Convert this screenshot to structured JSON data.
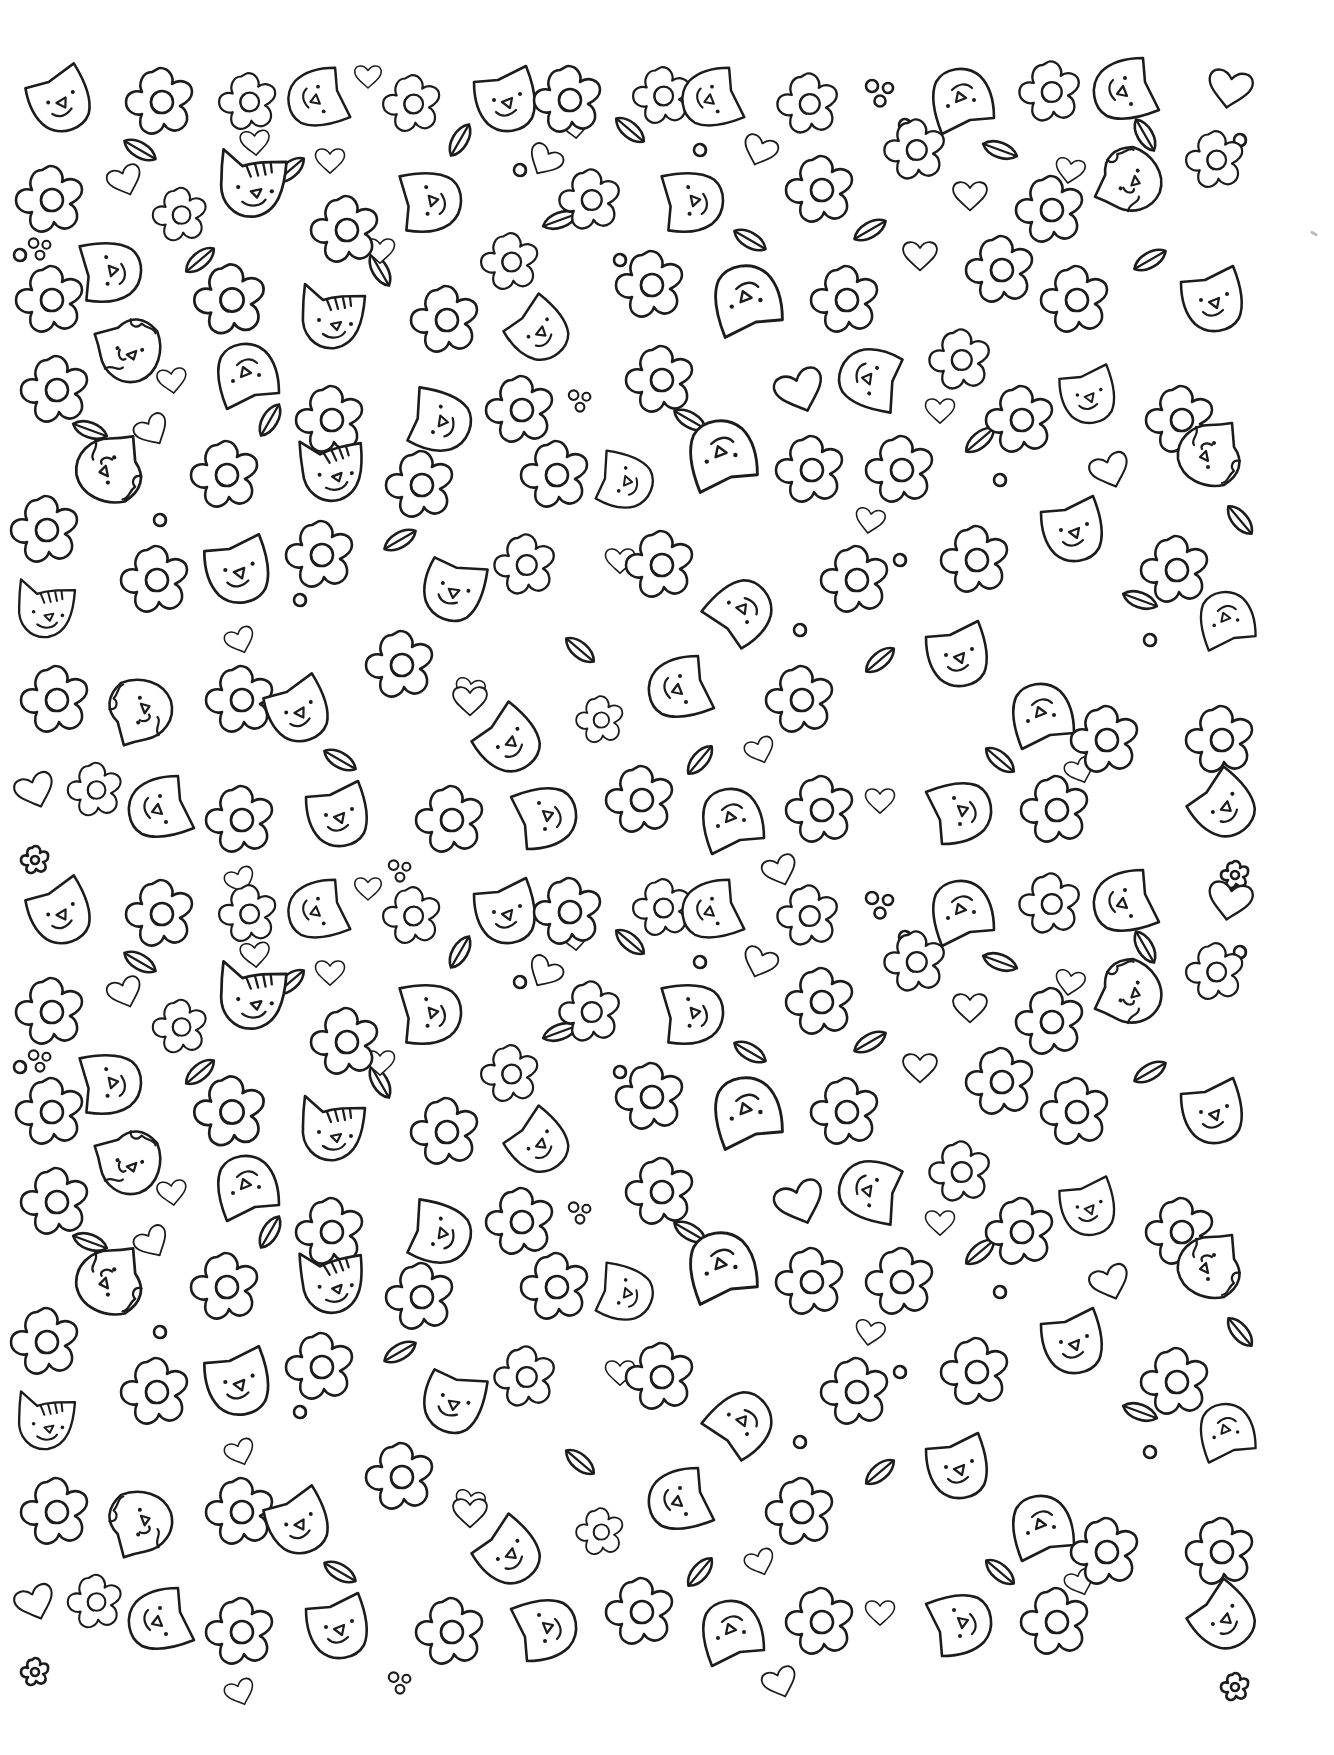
{
  "page": {
    "type": "coloring-page",
    "background": "#ffffff",
    "line_color": "#1c1c1c",
    "pattern_bounds": {
      "x": 10,
      "y": 62,
      "width": 1270,
      "height": 1630
    }
  },
  "motif_types": [
    "cat",
    "cat-striped",
    "cat-spotted",
    "flower",
    "flower-small",
    "heart",
    "leaf",
    "dots"
  ],
  "tile": {
    "origin_y_offsets": [
      0,
      812
    ],
    "motifs": [
      {
        "t": "cat",
        "x": 62,
        "y": 100,
        "r": -10,
        "s": 1
      },
      {
        "t": "flower",
        "x": 160,
        "y": 102,
        "r": 0,
        "s": 1
      },
      {
        "t": "flower",
        "x": 248,
        "y": 102,
        "r": 0,
        "s": 0.85
      },
      {
        "t": "cat",
        "x": 318,
        "y": 100,
        "r": 90,
        "s": 0.95
      },
      {
        "t": "heart",
        "x": 368,
        "y": 76,
        "r": 0,
        "s": 0.55
      },
      {
        "t": "flower",
        "x": 412,
        "y": 104,
        "r": 0,
        "s": 0.85
      },
      {
        "t": "cat",
        "x": 508,
        "y": 100,
        "r": 0,
        "s": 1
      },
      {
        "t": "flower",
        "x": 568,
        "y": 100,
        "r": 0,
        "s": 1
      },
      {
        "t": "flower",
        "x": 662,
        "y": 96,
        "r": 0,
        "s": 0.85
      },
      {
        "t": "cat",
        "x": 712,
        "y": 100,
        "r": 90,
        "s": 0.95
      },
      {
        "t": "flower",
        "x": 808,
        "y": 104,
        "r": 0,
        "s": 0.9
      },
      {
        "t": "dots",
        "x": 880,
        "y": 92,
        "r": 0,
        "s": 1
      },
      {
        "t": "cat",
        "x": 960,
        "y": 100,
        "r": 180,
        "s": 1
      },
      {
        "t": "flower",
        "x": 1050,
        "y": 92,
        "r": 0,
        "s": 0.9
      },
      {
        "t": "cat",
        "x": 1125,
        "y": 92,
        "r": 90,
        "s": 1
      },
      {
        "t": "heart",
        "x": 1230,
        "y": 88,
        "r": 10,
        "s": 0.9
      },
      {
        "t": "flower",
        "x": 50,
        "y": 200,
        "r": 0,
        "s": 1
      },
      {
        "t": "heart",
        "x": 125,
        "y": 180,
        "r": -20,
        "s": 0.7
      },
      {
        "t": "flower",
        "x": 180,
        "y": 215,
        "r": 0,
        "s": 0.8
      },
      {
        "t": "cat-striped",
        "x": 255,
        "y": 185,
        "r": 0,
        "s": 1.05
      },
      {
        "t": "flower",
        "x": 345,
        "y": 230,
        "r": 0,
        "s": 1
      },
      {
        "t": "heart",
        "x": 330,
        "y": 160,
        "r": 0,
        "s": 0.6
      },
      {
        "t": "cat",
        "x": 430,
        "y": 200,
        "r": -80,
        "s": 1
      },
      {
        "t": "heart",
        "x": 545,
        "y": 160,
        "r": 30,
        "s": 0.7
      },
      {
        "t": "flower",
        "x": 590,
        "y": 200,
        "r": 0,
        "s": 0.9
      },
      {
        "t": "cat",
        "x": 692,
        "y": 200,
        "r": -80,
        "s": 1
      },
      {
        "t": "heart",
        "x": 760,
        "y": 150,
        "r": 20,
        "s": 0.7
      },
      {
        "t": "flower",
        "x": 820,
        "y": 190,
        "r": 0,
        "s": 1
      },
      {
        "t": "flower",
        "x": 915,
        "y": 150,
        "r": 0,
        "s": 0.9
      },
      {
        "t": "heart",
        "x": 970,
        "y": 195,
        "r": 0,
        "s": 0.7
      },
      {
        "t": "flower",
        "x": 1050,
        "y": 210,
        "r": 0,
        "s": 1
      },
      {
        "t": "cat-spotted",
        "x": 1130,
        "y": 180,
        "r": -60,
        "s": 1
      },
      {
        "t": "flower",
        "x": 1215,
        "y": 160,
        "r": 0,
        "s": 0.85
      },
      {
        "t": "cat",
        "x": 110,
        "y": 270,
        "r": -80,
        "s": 1
      },
      {
        "t": "dots",
        "x": 40,
        "y": 248,
        "r": 0,
        "s": 0.8
      },
      {
        "t": "flower",
        "x": 50,
        "y": 300,
        "r": 0,
        "s": 1
      },
      {
        "t": "flower",
        "x": 230,
        "y": 300,
        "r": 0,
        "s": 1.05
      },
      {
        "t": "cat-striped",
        "x": 335,
        "y": 318,
        "r": 0,
        "s": 1
      },
      {
        "t": "flower",
        "x": 445,
        "y": 320,
        "r": 0,
        "s": 1
      },
      {
        "t": "flower",
        "x": 510,
        "y": 262,
        "r": 0,
        "s": 0.85
      },
      {
        "t": "cat",
        "x": 540,
        "y": 330,
        "r": -30,
        "s": 0.95
      },
      {
        "t": "flower",
        "x": 650,
        "y": 285,
        "r": 0,
        "s": 1
      },
      {
        "t": "cat",
        "x": 745,
        "y": 300,
        "r": 180,
        "s": 1.1
      },
      {
        "t": "flower",
        "x": 845,
        "y": 300,
        "r": 0,
        "s": 1
      },
      {
        "t": "heart",
        "x": 920,
        "y": 255,
        "r": 0,
        "s": 0.7
      },
      {
        "t": "flower",
        "x": 1000,
        "y": 270,
        "r": 0,
        "s": 1
      },
      {
        "t": "flower",
        "x": 1075,
        "y": 300,
        "r": 0,
        "s": 1
      },
      {
        "t": "cat",
        "x": 1215,
        "y": 300,
        "r": 0,
        "s": 1
      },
      {
        "t": "cat-spotted",
        "x": 130,
        "y": 350,
        "r": -10,
        "s": 1
      },
      {
        "t": "flower",
        "x": 55,
        "y": 390,
        "r": 0,
        "s": 1
      },
      {
        "t": "cat",
        "x": 245,
        "y": 375,
        "r": 180,
        "s": 1
      },
      {
        "t": "flower",
        "x": 330,
        "y": 420,
        "r": 0,
        "s": 1
      },
      {
        "t": "heart",
        "x": 152,
        "y": 430,
        "r": -30,
        "s": 0.7
      },
      {
        "t": "cat",
        "x": 440,
        "y": 420,
        "r": -60,
        "s": 1
      },
      {
        "t": "flower",
        "x": 520,
        "y": 410,
        "r": 0,
        "s": 1
      },
      {
        "t": "dots",
        "x": 580,
        "y": 400,
        "r": 0,
        "s": 0.8
      },
      {
        "t": "flower",
        "x": 660,
        "y": 380,
        "r": 0,
        "s": 1
      },
      {
        "t": "heart",
        "x": 800,
        "y": 390,
        "r": -20,
        "s": 1
      },
      {
        "t": "cat",
        "x": 870,
        "y": 380,
        "r": 120,
        "s": 1
      },
      {
        "t": "flower",
        "x": 960,
        "y": 360,
        "r": 0,
        "s": 0.9
      },
      {
        "t": "flower",
        "x": 1020,
        "y": 420,
        "r": 0,
        "s": 1
      },
      {
        "t": "cat",
        "x": 1090,
        "y": 395,
        "r": 0,
        "s": 0.9
      },
      {
        "t": "flower",
        "x": 1180,
        "y": 420,
        "r": 0,
        "s": 1
      },
      {
        "t": "cat-spotted",
        "x": 110,
        "y": 470,
        "r": 90,
        "s": 1.05
      },
      {
        "t": "flower",
        "x": 45,
        "y": 530,
        "r": 0,
        "s": 1
      },
      {
        "t": "flower",
        "x": 225,
        "y": 475,
        "r": 0,
        "s": 1
      },
      {
        "t": "cat-striped",
        "x": 335,
        "y": 470,
        "r": -10,
        "s": 1
      },
      {
        "t": "flower",
        "x": 420,
        "y": 485,
        "r": 0,
        "s": 1
      },
      {
        "t": "flower",
        "x": 555,
        "y": 475,
        "r": 0,
        "s": 1
      },
      {
        "t": "cat",
        "x": 625,
        "y": 480,
        "r": -60,
        "s": 0.9
      },
      {
        "t": "cat",
        "x": 720,
        "y": 455,
        "r": 180,
        "s": 1.1
      },
      {
        "t": "flower",
        "x": 810,
        "y": 470,
        "r": 0,
        "s": 1
      },
      {
        "t": "flower",
        "x": 900,
        "y": 470,
        "r": 0,
        "s": 1
      },
      {
        "t": "cat-spotted",
        "x": 1210,
        "y": 455,
        "r": 90,
        "s": 1
      },
      {
        "t": "heart",
        "x": 1110,
        "y": 470,
        "r": -20,
        "s": 0.8
      },
      {
        "t": "flower",
        "x": 155,
        "y": 580,
        "r": 0,
        "s": 1
      },
      {
        "t": "cat",
        "x": 240,
        "y": 570,
        "r": 0,
        "s": 1.05
      },
      {
        "t": "flower",
        "x": 320,
        "y": 555,
        "r": 0,
        "s": 1
      },
      {
        "t": "cat",
        "x": 455,
        "y": 590,
        "r": 30,
        "s": 1
      },
      {
        "t": "flower",
        "x": 525,
        "y": 565,
        "r": 0,
        "s": 0.9
      },
      {
        "t": "flower",
        "x": 660,
        "y": 565,
        "r": 0,
        "s": 1
      },
      {
        "t": "cat",
        "x": 740,
        "y": 610,
        "r": -120,
        "s": 1
      },
      {
        "t": "flower",
        "x": 855,
        "y": 580,
        "r": 0,
        "s": 1
      },
      {
        "t": "cat",
        "x": 1075,
        "y": 530,
        "r": 0,
        "s": 1
      },
      {
        "t": "flower",
        "x": 975,
        "y": 560,
        "r": 0,
        "s": 1
      },
      {
        "t": "cat-striped",
        "x": 48,
        "y": 610,
        "r": 0,
        "s": 0.9
      },
      {
        "t": "flower",
        "x": 1175,
        "y": 570,
        "r": 0,
        "s": 1
      },
      {
        "t": "cat",
        "x": 1225,
        "y": 620,
        "r": 180,
        "s": 0.9
      },
      {
        "t": "flower",
        "x": 55,
        "y": 700,
        "r": 0,
        "s": 1
      },
      {
        "t": "cat-spotted",
        "x": 140,
        "y": 710,
        "r": -100,
        "s": 1
      },
      {
        "t": "flower",
        "x": 240,
        "y": 700,
        "r": 0,
        "s": 1
      },
      {
        "t": "cat",
        "x": 300,
        "y": 710,
        "r": -10,
        "s": 1
      },
      {
        "t": "flower",
        "x": 400,
        "y": 665,
        "r": 0,
        "s": 1
      },
      {
        "t": "cat",
        "x": 510,
        "y": 740,
        "r": -30,
        "s": 1
      },
      {
        "t": "heart",
        "x": 470,
        "y": 700,
        "r": 0,
        "s": 0.7
      },
      {
        "t": "flower",
        "x": 600,
        "y": 720,
        "r": 0,
        "s": 0.7
      },
      {
        "t": "cat",
        "x": 680,
        "y": 690,
        "r": 90,
        "s": 1
      },
      {
        "t": "flower",
        "x": 800,
        "y": 700,
        "r": 0,
        "s": 1
      },
      {
        "t": "cat",
        "x": 960,
        "y": 655,
        "r": 0,
        "s": 1
      },
      {
        "t": "cat",
        "x": 1040,
        "y": 715,
        "r": 180,
        "s": 1
      },
      {
        "t": "flower",
        "x": 1105,
        "y": 740,
        "r": 0,
        "s": 1
      },
      {
        "t": "flower",
        "x": 1220,
        "y": 740,
        "r": 0,
        "s": 1
      },
      {
        "t": "heart",
        "x": 35,
        "y": 790,
        "r": -20,
        "s": 0.8
      },
      {
        "t": "flower",
        "x": 95,
        "y": 790,
        "r": 0,
        "s": 0.8
      },
      {
        "t": "cat",
        "x": 160,
        "y": 810,
        "r": 90,
        "s": 1
      },
      {
        "t": "flower",
        "x": 240,
        "y": 820,
        "r": 0,
        "s": 1
      },
      {
        "t": "cat",
        "x": 340,
        "y": 815,
        "r": 0,
        "s": 1
      },
      {
        "t": "flower",
        "x": 450,
        "y": 820,
        "r": 0,
        "s": 1
      },
      {
        "t": "cat",
        "x": 545,
        "y": 815,
        "r": -90,
        "s": 1
      },
      {
        "t": "flower",
        "x": 640,
        "y": 800,
        "r": 0,
        "s": 1
      },
      {
        "t": "cat",
        "x": 730,
        "y": 820,
        "r": 180,
        "s": 1
      },
      {
        "t": "flower",
        "x": 820,
        "y": 810,
        "r": 0,
        "s": 1
      },
      {
        "t": "heart",
        "x": 880,
        "y": 800,
        "r": 0,
        "s": 0.6
      },
      {
        "t": "cat",
        "x": 960,
        "y": 810,
        "r": -90,
        "s": 1
      },
      {
        "t": "flower",
        "x": 1055,
        "y": 810,
        "r": 0,
        "s": 1
      },
      {
        "t": "cat",
        "x": 1225,
        "y": 805,
        "r": -30,
        "s": 1
      },
      {
        "t": "flower-small",
        "x": 35,
        "y": 860,
        "r": 0,
        "s": 1
      },
      {
        "t": "heart",
        "x": 240,
        "y": 880,
        "r": -20,
        "s": 0.6
      },
      {
        "t": "dots",
        "x": 400,
        "y": 870,
        "r": 0,
        "s": 0.8
      },
      {
        "t": "heart",
        "x": 780,
        "y": 870,
        "r": -20,
        "s": 0.7
      },
      {
        "t": "flower-small",
        "x": 1235,
        "y": 875,
        "r": 0,
        "s": 1
      }
    ]
  },
  "scatter": {
    "hearts": [
      [
        255,
        142
      ],
      [
        575,
        125
      ],
      [
        1070,
        170
      ],
      [
        172,
        380
      ],
      [
        940,
        410
      ],
      [
        470,
        690
      ],
      [
        760,
        750
      ],
      [
        1080,
        770
      ],
      [
        380,
        250
      ],
      [
        620,
        560
      ],
      [
        240,
        640
      ],
      [
        870,
        520
      ]
    ],
    "dots": [
      [
        20,
        255
      ],
      [
        115,
        250
      ],
      [
        520,
        170
      ],
      [
        700,
        150
      ],
      [
        905,
        125
      ],
      [
        980,
        110
      ],
      [
        1240,
        140
      ],
      [
        620,
        260
      ],
      [
        900,
        560
      ],
      [
        1150,
        640
      ],
      [
        300,
        600
      ],
      [
        800,
        630
      ],
      [
        160,
        520
      ],
      [
        1000,
        480
      ]
    ],
    "leaves": [
      [
        140,
        150,
        30
      ],
      [
        290,
        170,
        -40
      ],
      [
        380,
        270,
        60
      ],
      [
        460,
        140,
        -60
      ],
      [
        630,
        130,
        40
      ],
      [
        870,
        230,
        -30
      ],
      [
        1000,
        150,
        20
      ],
      [
        1145,
        135,
        60
      ],
      [
        200,
        260,
        -40
      ],
      [
        560,
        220,
        -20
      ],
      [
        750,
        240,
        30
      ],
      [
        1150,
        260,
        -30
      ],
      [
        90,
        430,
        20
      ],
      [
        270,
        420,
        -60
      ],
      [
        690,
        420,
        30
      ],
      [
        980,
        440,
        -40
      ],
      [
        1240,
        520,
        50
      ],
      [
        400,
        540,
        -30
      ],
      [
        580,
        650,
        40
      ],
      [
        880,
        660,
        -40
      ],
      [
        1140,
        600,
        20
      ],
      [
        340,
        760,
        30
      ],
      [
        700,
        760,
        -50
      ],
      [
        1000,
        760,
        40
      ]
    ]
  }
}
